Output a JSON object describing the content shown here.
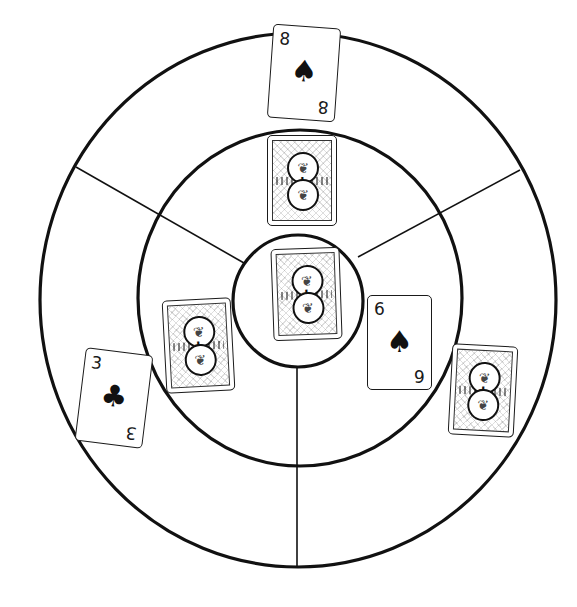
{
  "board": {
    "background": "#ffffff",
    "line_color": "#111111",
    "rings": [
      {
        "name": "outer",
        "cx": 298,
        "cy": 300,
        "rx": 258,
        "ry": 267
      },
      {
        "name": "middle",
        "cx": 300,
        "cy": 298,
        "rx": 162,
        "ry": 168
      },
      {
        "name": "inner",
        "cx": 298,
        "cy": 301,
        "rx": 65,
        "ry": 66
      }
    ],
    "dividers": [
      {
        "name": "top-left",
        "x1": 76,
        "y1": 167,
        "x2": 244,
        "y2": 263
      },
      {
        "name": "top-right",
        "x1": 520,
        "y1": 170,
        "x2": 358,
        "y2": 257
      },
      {
        "name": "bottom",
        "x1": 297,
        "y1": 368,
        "x2": 297,
        "y2": 567
      }
    ]
  },
  "cards": {
    "eight_spades": {
      "rank": "8",
      "suit": "♠",
      "suit_name": "spades",
      "face_up": true
    },
    "six_spades": {
      "rank": "6",
      "suit": "♠",
      "suit_name": "spades",
      "face_up": true
    },
    "three_clubs": {
      "rank": "3",
      "suit": "♣",
      "suit_name": "clubs",
      "face_up": true
    },
    "back_top": {
      "face_up": false
    },
    "back_center": {
      "face_up": false
    },
    "back_left": {
      "face_up": false
    },
    "back_right": {
      "face_up": false
    }
  },
  "card_back": {
    "medal_glyph": "❦",
    "cross_glyph": "✚"
  }
}
